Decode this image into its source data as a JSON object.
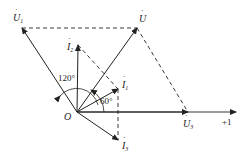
{
  "diagram": {
    "type": "phasor-diagram",
    "origin_label": "O",
    "axis_label": "+1",
    "vectors": [
      {
        "name": "U",
        "label": "U",
        "dot": true,
        "subscript": ""
      },
      {
        "name": "U1",
        "label": "U",
        "dot": true,
        "subscript": "1"
      },
      {
        "name": "U3",
        "label": "U",
        "dot": true,
        "subscript": "3"
      },
      {
        "name": "I1",
        "label": "I",
        "dot": true,
        "subscript": "1"
      },
      {
        "name": "I2",
        "label": "I",
        "dot": true,
        "subscript": "2"
      },
      {
        "name": "I3",
        "label": "I",
        "dot": true,
        "subscript": "3"
      }
    ],
    "angles": [
      {
        "label": "120°"
      },
      {
        "label": "60°"
      }
    ],
    "colors": {
      "line": "#222222",
      "background": "#ffffff"
    }
  }
}
